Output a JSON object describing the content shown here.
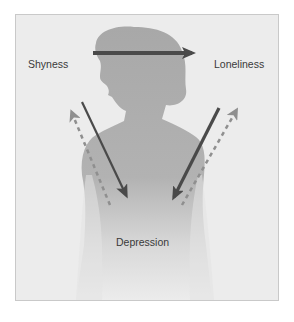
{
  "diagram": {
    "type": "concept-diagram",
    "nodes": {
      "shyness": "Shyness",
      "loneliness": "Loneliness",
      "depression": "Depression"
    },
    "edges": [
      {
        "from": "Shyness",
        "to": "Loneliness",
        "style": "solid",
        "color": "#4a4a4a"
      },
      {
        "from": "Shyness",
        "to": "Depression",
        "style": "solid",
        "color": "#4a4a4a"
      },
      {
        "from": "Loneliness",
        "to": "Depression",
        "style": "solid",
        "color": "#4a4a4a"
      },
      {
        "from": "Depression",
        "to": "Shyness",
        "style": "dashed",
        "color": "#8f8f8f"
      },
      {
        "from": "Depression",
        "to": "Loneliness",
        "style": "dashed",
        "color": "#8f8f8f"
      }
    ],
    "background": "woman-silhouette",
    "colors": {
      "panel_bg": "#ececec",
      "silhouette": "#a9a9a9",
      "solid_arrow": "#4a4a4a",
      "dashed_arrow": "#8f8f8f",
      "border": "#c9c9c9"
    }
  }
}
